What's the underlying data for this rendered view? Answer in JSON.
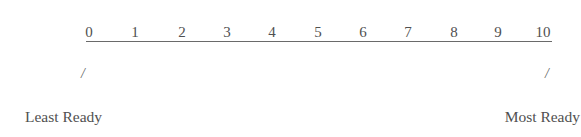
{
  "scale": {
    "ticks": [
      "0",
      "1",
      "2",
      "3",
      "4",
      "5",
      "6",
      "7",
      "8",
      "9",
      "10"
    ],
    "min": 0,
    "max": 10
  },
  "markers": {
    "left": "/",
    "right": "/"
  },
  "anchors": {
    "left": "Least Ready",
    "right": "Most Ready"
  },
  "colors": {
    "text": "#505050",
    "line": "#6a6a6a"
  }
}
